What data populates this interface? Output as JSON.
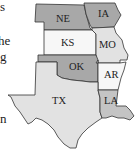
{
  "left_text_fragments": [
    {
      "text": "s",
      "x": 0,
      "y": 0
    },
    {
      "text": "he",
      "x": 0,
      "y": 34
    },
    {
      "text": "g",
      "x": 0,
      "y": 50
    },
    {
      "text": "n",
      "x": 0,
      "y": 112
    }
  ],
  "map": {
    "colors": {
      "dark": "#a8a8a8",
      "medium": "#c4c4c4",
      "light": "#e2e2e2",
      "white": "#f7f7f7",
      "border": "#333333"
    },
    "states": [
      {
        "abbr": "NE",
        "shade": "dark"
      },
      {
        "abbr": "IA",
        "shade": "dark"
      },
      {
        "abbr": "KS",
        "shade": "white"
      },
      {
        "abbr": "MO",
        "shade": "light"
      },
      {
        "abbr": "OK",
        "shade": "dark"
      },
      {
        "abbr": "AR",
        "shade": "white"
      },
      {
        "abbr": "TX",
        "shade": "light"
      },
      {
        "abbr": "LA",
        "shade": "medium"
      }
    ]
  }
}
